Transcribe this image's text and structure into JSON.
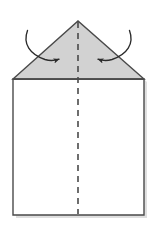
{
  "figure": {
    "caption": ""
  },
  "colors": {
    "background": "#ffffff",
    "paper_fill": "#ffffff",
    "flap_fill": "#d2d2d2",
    "outline": "#4a4a4a",
    "fold_line": "#4a4a4a",
    "arrow": "#2b2b2b",
    "shadow": "#d9d9d9"
  },
  "shapes": {
    "square": {
      "name": "paper-square",
      "left": 13,
      "top": 79,
      "right": 144,
      "bottom": 215,
      "points": "13,79 144,79 144,215 13,215"
    },
    "triangle_flap": {
      "name": "folded-triangle-flap",
      "apex_x": 78,
      "apex_y": 21,
      "left_x": 13,
      "left_y": 79,
      "right_x": 144,
      "right_y": 79,
      "points": "13,79 78,21 144,79"
    },
    "fold_line": {
      "name": "center-fold-dashed-line",
      "x": 78,
      "y_start": 22,
      "y_end": 214,
      "dash": "6 5",
      "width": 1.6
    },
    "shadow_offset": {
      "x": 3,
      "y": 3
    }
  },
  "arrows": [
    {
      "name": "left-fold-arrow",
      "path": "M 27.5,30.5 C 22.5,44 30,54.5 45,59.5 C 50,61 55,60.5 59,59.2",
      "head_x": 61.5,
      "head_y": 58.5,
      "head_angle": -18,
      "direction": "inward-right"
    },
    {
      "name": "right-fold-arrow",
      "path": "M 129.5,30.5 C 134.5,44 127,54.5 112,59.5 C 107,61 102,60.5 98,59.2",
      "head_x": 95.5,
      "head_y": 58.5,
      "head_angle": 198,
      "direction": "inward-left"
    }
  ],
  "labels": []
}
